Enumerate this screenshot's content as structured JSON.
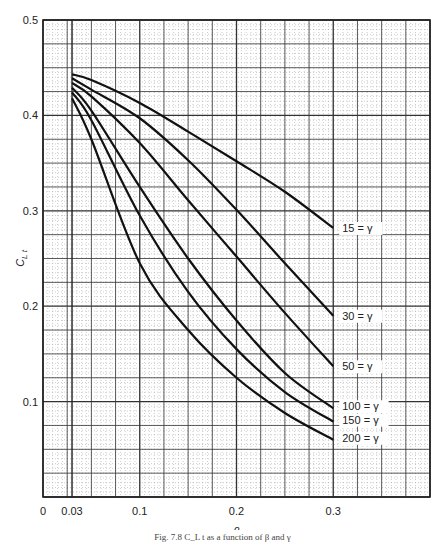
{
  "chart_data": {
    "type": "line",
    "title": "",
    "xlabel": "β",
    "ylabel": "C_L t",
    "xlim": [
      0,
      0.4
    ],
    "ylim": [
      0,
      0.5
    ],
    "x_ticks": [
      "0",
      "0.03",
      "0.1",
      "0.2",
      "0.3"
    ],
    "x_tick_values": [
      0,
      0.03,
      0.1,
      0.2,
      0.3
    ],
    "y_ticks": [
      "0.1",
      "0.2",
      "0.3",
      "0.4",
      "0.5"
    ],
    "y_tick_values": [
      0.1,
      0.2,
      0.3,
      0.4,
      0.5
    ],
    "grid": true,
    "x": [
      0.03,
      0.05,
      0.1,
      0.15,
      0.2,
      0.25,
      0.3
    ],
    "series": [
      {
        "name": "15 = γ",
        "label": "15 = γ",
        "values": [
          0.443,
          0.437,
          0.413,
          0.383,
          0.352,
          0.32,
          0.282
        ]
      },
      {
        "name": "30 = γ",
        "label": "30 = γ",
        "values": [
          0.439,
          0.427,
          0.397,
          0.353,
          0.301,
          0.245,
          0.19
        ]
      },
      {
        "name": "50 = γ",
        "label": "50 = γ",
        "values": [
          0.434,
          0.42,
          0.371,
          0.311,
          0.252,
          0.193,
          0.137
        ]
      },
      {
        "name": "100 = γ",
        "label": "100 = γ",
        "values": [
          0.429,
          0.405,
          0.325,
          0.25,
          0.185,
          0.13,
          0.093
        ]
      },
      {
        "name": "150 = γ",
        "label": "150 = γ",
        "values": [
          0.424,
          0.395,
          0.295,
          0.215,
          0.155,
          0.11,
          0.079
        ]
      },
      {
        "name": "200 = γ",
        "label": "200 = γ",
        "values": [
          0.418,
          0.375,
          0.245,
          0.175,
          0.125,
          0.088,
          0.06
        ]
      }
    ],
    "legend_position": "inline labels at right end of each curve"
  },
  "caption": "Fig. 7.8   C_L t as a function of β and γ"
}
